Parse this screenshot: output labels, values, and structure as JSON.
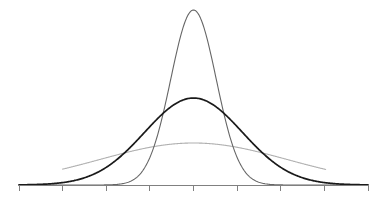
{
  "chart_data": {
    "type": "line",
    "title": "",
    "subtitle": "",
    "xlabel": "",
    "ylabel": "",
    "grid": false,
    "legend": false,
    "legend_position": "none",
    "x": [
      -4,
      -3,
      -2,
      -1,
      0,
      1,
      2,
      3,
      4
    ],
    "xlim": [
      -4,
      4
    ],
    "ylim": [
      0,
      1
    ],
    "xtick_labels": [
      "",
      "",
      "",
      "",
      "",
      "",
      "",
      "",
      ""
    ],
    "ytick_labels": [],
    "series": [
      {
        "name": "narrow",
        "mean": 0,
        "sigma": 0.52,
        "peak_value": 1.0,
        "color": "#666666",
        "stroke_width": 1.1,
        "x_start": -4.0,
        "x_end": 4.0,
        "values": [
          0.0,
          0.0,
          0.0003,
          0.1512,
          1.0,
          0.1512,
          0.0003,
          0.0,
          0.0
        ]
      },
      {
        "name": "medium",
        "mean": 0,
        "sigma": 1.12,
        "peak_value": 0.497,
        "color": "#1a1a1a",
        "stroke_width": 1.7,
        "x_start": -4.0,
        "x_end": 4.0,
        "values": [
          0.0011,
          0.0144,
          0.1015,
          0.3943,
          0.497,
          0.3943,
          0.1015,
          0.0144,
          0.0011
        ]
      },
      {
        "name": "wide",
        "mean": 0,
        "sigma": 2.15,
        "peak_value": 0.24,
        "color": "#b0b0b0",
        "stroke_width": 1.1,
        "x_start": -3.0,
        "x_end": 3.03,
        "values": [
          0.0,
          0.0934,
          0.1584,
          0.2155,
          0.24,
          0.2155,
          0.1584,
          0.0934,
          0.0
        ]
      }
    ],
    "axis": {
      "color": "#808080",
      "stroke_width": 1.0,
      "tick_count": 9,
      "tick_length": 6,
      "tick_color": "#808080",
      "baseline_y_px": 185,
      "x_start_px": 19,
      "x_end_px": 368
    }
  },
  "figure": {
    "width": 385,
    "height": 201,
    "background": "#ffffff"
  }
}
